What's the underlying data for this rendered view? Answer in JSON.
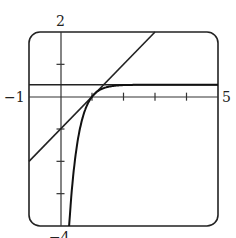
{
  "chart_data": {
    "type": "line",
    "title": "",
    "xlabel": "",
    "ylabel": "",
    "xlim": [
      -1,
      5
    ],
    "ylim": [
      -4,
      2
    ],
    "tick_labels": {
      "x_min": "−1",
      "x_max": "5",
      "y_max": "2",
      "y_min": "−4"
    },
    "x_ticks": [
      1,
      2,
      3,
      4
    ],
    "y_ticks": [
      1,
      -1,
      -2,
      -3
    ],
    "grid": false,
    "legend": null,
    "frame": "rounded-rectangle",
    "series": [
      {
        "name": "tangent line",
        "kind": "line",
        "equation": "y = x - 1",
        "x": [
          -1,
          2
        ],
        "y": [
          -2,
          1
        ]
      },
      {
        "name": "curve",
        "kind": "function",
        "equation": "y ≈ 0.37(1 - e^(-3.4(x-1)))",
        "x": [
          0.28,
          0.5,
          1.0,
          1.5,
          2.0,
          3.0,
          5.0
        ],
        "y": [
          -4.0,
          -1.6,
          0.0,
          0.3,
          0.36,
          0.37,
          0.37
        ]
      },
      {
        "name": "horizontal asymptote",
        "kind": "hline",
        "y": 0.37
      }
    ]
  },
  "labels": {
    "y_max": "2",
    "x_min": "−1",
    "x_max": "5",
    "y_min": "−4"
  }
}
